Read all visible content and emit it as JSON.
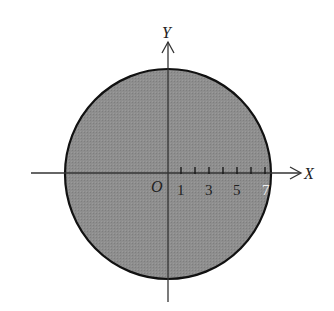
{
  "figure": {
    "type": "coordinate-diagram",
    "shape": "filled-circle",
    "fill_color": "#8c8c8c",
    "stroke_color": "#111111",
    "axes": {
      "x_label": "X",
      "y_label": "Y",
      "origin_label": "O"
    },
    "x_ticks": [
      "1",
      "3",
      "5",
      "7"
    ],
    "tick_count": 7
  }
}
